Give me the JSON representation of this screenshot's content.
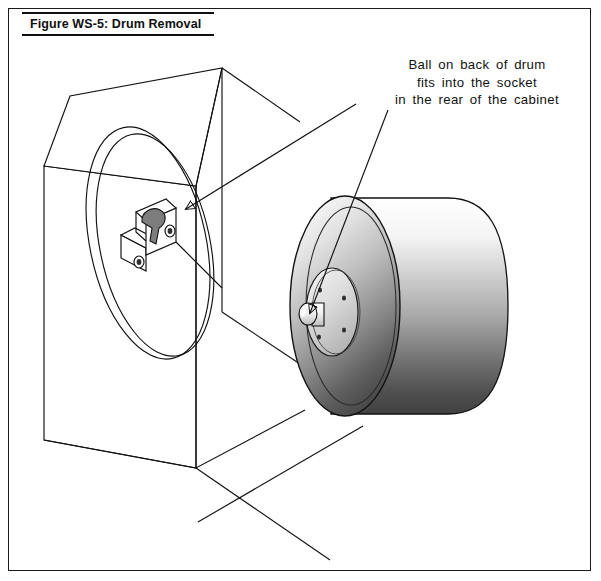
{
  "figure": {
    "title": "Figure WS-5: Drum Removal",
    "callout_lines": [
      "Ball on back of drum",
      "fits into the socket",
      "in the rear of the cabinet"
    ],
    "colors": {
      "ink": "#1b1b1b",
      "line": "#111111",
      "drum_highlight": "#ffffff",
      "drum_midtone": "#b9b9b9",
      "drum_shadow": "#4a4a4a",
      "hub_plate": "#d9d9d9",
      "socket_slot": "#7d7d7d",
      "paper": "#ffffff"
    },
    "parts": {
      "cabinet": "Cabinet enclosure shown as isometric wireframe box",
      "opening_ring": "Circular drum opening ring on cabinet front face",
      "socket_bracket": "Socket bracket with keyhole slot in rear of cabinet",
      "drum": "Cylindrical drum with shaded body",
      "hub_plate": "Drum back hub plate with four bolt holes",
      "ball": "Ball stud on back of drum",
      "floor": "Floor / base reference plane"
    },
    "leader_lines": {
      "to_socket": "Arrow from callout to socket bracket keyhole",
      "to_ball": "Arrow from callout to ball on drum hub",
      "to_floor": "Leader from drum base toward lower left"
    }
  }
}
